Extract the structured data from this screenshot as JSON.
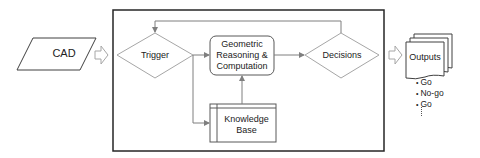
{
  "diagram": {
    "input": {
      "label": "CAD",
      "shape": "parallelogram"
    },
    "process_box": {
      "nodes": {
        "trigger": {
          "label": "Trigger",
          "shape": "diamond"
        },
        "geometric": {
          "label_lines": [
            "Geometric",
            "Reasoning &",
            "Computation"
          ],
          "shape": "rounded-rectangle"
        },
        "knowledge_base": {
          "label_lines": [
            "Knowledge",
            "Base"
          ],
          "shape": "internal-storage"
        },
        "decisions": {
          "label": "Decisions",
          "shape": "diamond"
        }
      },
      "edges": [
        {
          "from": "trigger",
          "to": "geometric"
        },
        {
          "from": "trigger",
          "to": "knowledge_base"
        },
        {
          "from": "knowledge_base",
          "to": "geometric"
        },
        {
          "from": "geometric",
          "to": "decisions"
        },
        {
          "from": "decisions",
          "to": "trigger",
          "type": "feedback"
        }
      ]
    },
    "output": {
      "label": "Outputs",
      "shape": "multi-document",
      "items": [
        "Go",
        "No-go",
        "Go"
      ],
      "more_indicator": "vertical-ellipsis"
    },
    "colors": {
      "shape_stroke": "#a6a6a6",
      "line": "#7f7f7f",
      "box_border": "#262626",
      "text": "#222222"
    }
  }
}
